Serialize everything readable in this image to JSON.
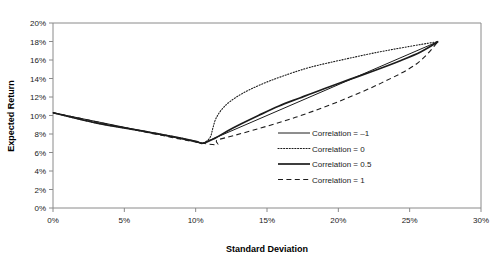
{
  "chart_data": {
    "type": "line",
    "title": "",
    "xlabel": "Standard Deviation",
    "ylabel": "Expected Return",
    "xlim": [
      0,
      30
    ],
    "ylim": [
      0,
      20
    ],
    "xticks": [
      "0%",
      "5%",
      "10%",
      "15%",
      "20%",
      "25%",
      "30%"
    ],
    "yticks": [
      "0%",
      "2%",
      "4%",
      "6%",
      "8%",
      "10%",
      "12%",
      "14%",
      "16%",
      "18%",
      "20%"
    ],
    "xtick_values": [
      0,
      5,
      10,
      15,
      20,
      25,
      30
    ],
    "ytick_values": [
      0,
      2,
      4,
      6,
      8,
      10,
      12,
      14,
      16,
      18,
      20
    ],
    "grid": false,
    "legend_position": "center-right",
    "units": "percent",
    "endpoints": {
      "asset_a": {
        "std": 0.0,
        "ret": 10.3
      },
      "asset_b": {
        "std": 27.0,
        "ret": 18.0
      },
      "kink": {
        "std": 10.5,
        "ret": 7.0
      }
    },
    "series": [
      {
        "name": "Correlation = -1",
        "style": "solid-thin",
        "points": [
          [
            0.0,
            10.3
          ],
          [
            10.5,
            7.0
          ],
          [
            27.0,
            18.0
          ]
        ]
      },
      {
        "name": "Correlation = 0",
        "style": "dotted",
        "points": [
          [
            0.0,
            10.3
          ],
          [
            3.0,
            9.2
          ],
          [
            6.0,
            8.4
          ],
          [
            8.5,
            7.7
          ],
          [
            10.0,
            7.2
          ],
          [
            10.5,
            7.0
          ],
          [
            11.0,
            7.6
          ],
          [
            11.2,
            8.6
          ],
          [
            11.4,
            9.6
          ],
          [
            11.8,
            10.6
          ],
          [
            12.4,
            11.5
          ],
          [
            13.3,
            12.4
          ],
          [
            14.5,
            13.3
          ],
          [
            16.0,
            14.2
          ],
          [
            18.0,
            15.2
          ],
          [
            20.5,
            16.1
          ],
          [
            23.3,
            17.0
          ],
          [
            27.0,
            18.0
          ]
        ]
      },
      {
        "name": "Correlation = 0.5",
        "style": "solid-thick",
        "points": [
          [
            0.0,
            10.3
          ],
          [
            3.0,
            9.2
          ],
          [
            6.0,
            8.4
          ],
          [
            8.5,
            7.7
          ],
          [
            10.0,
            7.2
          ],
          [
            10.5,
            7.0
          ],
          [
            11.3,
            7.5
          ],
          [
            12.2,
            8.3
          ],
          [
            13.2,
            9.1
          ],
          [
            14.4,
            10.0
          ],
          [
            15.8,
            11.0
          ],
          [
            17.3,
            11.9
          ],
          [
            19.0,
            12.9
          ],
          [
            20.8,
            13.9
          ],
          [
            22.6,
            14.9
          ],
          [
            24.3,
            15.9
          ],
          [
            25.8,
            16.9
          ],
          [
            27.0,
            18.0
          ]
        ]
      },
      {
        "name": "Correlation = 1",
        "style": "dashed",
        "points": [
          [
            0.0,
            10.3
          ],
          [
            10.5,
            7.0
          ],
          [
            11.6,
            7.4
          ],
          [
            14.0,
            8.4
          ],
          [
            17.0,
            9.8
          ],
          [
            20.0,
            11.5
          ],
          [
            23.0,
            13.5
          ],
          [
            25.5,
            15.6
          ],
          [
            27.0,
            18.0
          ]
        ]
      }
    ]
  },
  "legend": {
    "entries": [
      {
        "label": "Correlation = –1",
        "style": "solid-thin"
      },
      {
        "label": "Correlation = 0",
        "style": "dotted"
      },
      {
        "label": "Correlation = 0.5",
        "style": "solid-thick"
      },
      {
        "label": "Correlation = 1",
        "style": "dashed"
      }
    ]
  },
  "colors": {
    "line": "#1c1c1c",
    "axis": "#8a8a8a",
    "text": "#1a1a1a",
    "background": "#ffffff"
  }
}
